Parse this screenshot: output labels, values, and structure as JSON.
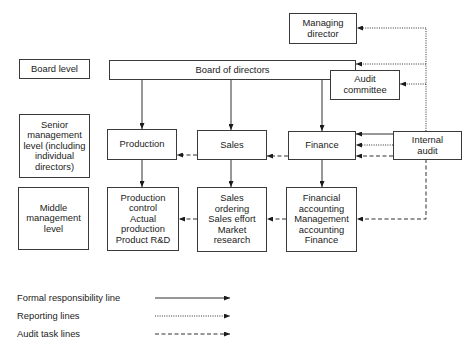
{
  "diagram": {
    "type": "organisation-chart",
    "level_labels": {
      "board": "Board level",
      "senior": "Senior\nmanagement\nlevel (including\nindividual\ndirectors)",
      "middle": "Middle\nmanagement\nlevel"
    },
    "boxes": {
      "managing_director": "Managing\ndirector",
      "board_of_directors": "Board of directors",
      "audit_committee": "Audit\ncommittee",
      "production": "Production",
      "sales": "Sales",
      "finance": "Finance",
      "internal_audit": "Internal\naudit",
      "production_control": "Production\ncontrol\nActual\nproduction\nProduct R&D",
      "sales_ordering": "Sales\nordering\nSales effort\nMarket\nresearch",
      "financial_accounting": "Financial\naccounting\nManagement\naccounting\nFinance"
    },
    "connections": [
      {
        "from": "Board of directors",
        "to": "Production",
        "type": "formal"
      },
      {
        "from": "Board of directors",
        "to": "Sales",
        "type": "formal"
      },
      {
        "from": "Board of directors",
        "to": "Finance",
        "type": "formal"
      },
      {
        "from": "Production",
        "to": "Production control / Actual production / Product R&D",
        "type": "formal"
      },
      {
        "from": "Sales",
        "to": "Sales ordering / Sales effort / Market research",
        "type": "formal"
      },
      {
        "from": "Finance",
        "to": "Financial accounting / Management accounting / Finance",
        "type": "formal"
      },
      {
        "from": "Internal audit",
        "to": "Finance",
        "type": "formal"
      },
      {
        "from": "Internal audit",
        "to": "Managing director",
        "type": "reporting"
      },
      {
        "from": "Internal audit",
        "to": "Board of directors",
        "type": "reporting"
      },
      {
        "from": "Internal audit",
        "to": "Audit committee",
        "type": "reporting"
      },
      {
        "from": "Internal audit",
        "to": "Finance",
        "type": "reporting"
      },
      {
        "from": "Internal audit",
        "to": "Finance",
        "type": "audit"
      },
      {
        "from": "Finance",
        "to": "Sales",
        "type": "audit"
      },
      {
        "from": "Sales",
        "to": "Production",
        "type": "audit"
      },
      {
        "from": "Internal audit",
        "to": "Financial accounting / Management accounting / Finance",
        "type": "audit"
      },
      {
        "from": "Financial accounting / Management accounting / Finance",
        "to": "Sales ordering / Sales effort / Market research",
        "type": "audit"
      },
      {
        "from": "Sales ordering / Sales effort / Market research",
        "to": "Production control / Actual production / Product R&D",
        "type": "audit"
      }
    ],
    "legend": [
      {
        "label": "Formal responsibility line",
        "style": "solid"
      },
      {
        "label": "Reporting lines",
        "style": "dotted"
      },
      {
        "label": "Audit task lines",
        "style": "dashed"
      }
    ],
    "colors": {
      "line": "#1a1a1a",
      "text": "#222222",
      "background": "#ffffff"
    }
  }
}
